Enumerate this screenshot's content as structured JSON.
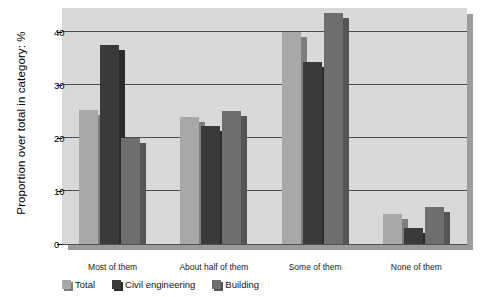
{
  "chart_data": {
    "type": "bar",
    "title": "",
    "xlabel": "",
    "ylabel": "Proportion over total in category: %",
    "categories": [
      "Most of them",
      "About half of them",
      "Some of them",
      "None of them"
    ],
    "series": [
      {
        "name": "Total",
        "color": "#a8a8a8",
        "shadow": "#7e7e7e",
        "values": [
          25.3,
          24.0,
          40.0,
          5.6
        ]
      },
      {
        "name": "Civil engineering",
        "color": "#3a3a3a",
        "shadow": "#2b2b2b",
        "values": [
          37.5,
          22.3,
          34.3,
          3.0
        ]
      },
      {
        "name": "Building",
        "color": "#6e6e6e",
        "shadow": "#555555",
        "values": [
          20.0,
          25.0,
          43.5,
          7.0
        ]
      }
    ],
    "yticks": [
      0,
      10,
      20,
      30,
      40
    ],
    "ytick_labels": [
      "0",
      "10",
      "20",
      "30",
      "40"
    ],
    "ylim": [
      0,
      44.5
    ],
    "grid": true,
    "legend_position": "bottom-left",
    "plot_background": "#d9d9d9"
  }
}
